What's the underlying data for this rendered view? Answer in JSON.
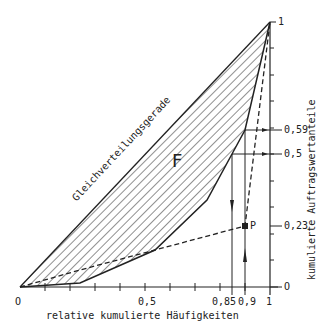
{
  "diagram": {
    "type": "lorenz-curve",
    "x_axis": {
      "title": "relative kumulierte Häufigkeiten",
      "labels": [
        "O",
        "0,5",
        "0,85",
        "0,9",
        "1"
      ]
    },
    "y_axis": {
      "title": "kumulierte Auftragswertanteile",
      "labels": [
        "O",
        "0,23",
        "0,5",
        "0,59",
        "1"
      ]
    },
    "equality_line_label": "Gleichverteilungsgerade",
    "area_label": "F",
    "point_label": "P",
    "lorenz_curve_points": [
      [
        0,
        0
      ],
      [
        0.24,
        0.02
      ],
      [
        0.54,
        0.14
      ],
      [
        0.75,
        0.33
      ],
      [
        0.85,
        0.5
      ],
      [
        0.9,
        0.59
      ],
      [
        1,
        1
      ]
    ],
    "point_P": [
      0.9,
      0.23
    ],
    "colors": {
      "line": "#222222",
      "background": "#ffffff"
    }
  }
}
